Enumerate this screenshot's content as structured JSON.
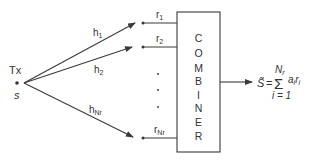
{
  "diagram": {
    "type": "receive-diversity-combiner",
    "transmitter": {
      "label": "Tx",
      "symbol": "s"
    },
    "channels": [
      {
        "label": "h",
        "subscript": "1"
      },
      {
        "label": "h",
        "subscript": "2"
      },
      {
        "label": "h",
        "subscript": "Nr"
      }
    ],
    "received": [
      {
        "label": "r",
        "subscript": "1"
      },
      {
        "label": "r",
        "subscript": "2"
      },
      {
        "label": "r",
        "subscript": "Nr"
      }
    ],
    "ellipsis": "⋮",
    "combiner": {
      "label": "COMBINER",
      "letters": [
        "C",
        "O",
        "M",
        "B",
        "I",
        "N",
        "E",
        "R"
      ]
    },
    "output_formula": {
      "lhs": "S̃",
      "equals": "=",
      "sum_symbol": "Σ",
      "upper_limit": "N",
      "upper_limit_sub": "r",
      "lower_limit": "i = 1",
      "term": "a",
      "term_sub": "i",
      "term2": "r",
      "term2_sub": "i",
      "text": "S̃ = Σ_{i=1}^{N_r} a_i r_i"
    },
    "colors": {
      "line": "#3a3a3a",
      "text": "#333333",
      "background": "#ffffff"
    }
  }
}
